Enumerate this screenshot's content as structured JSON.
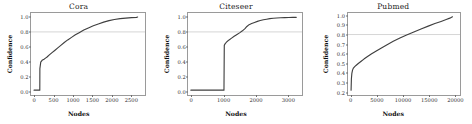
{
  "figure": {
    "background": "#ffffff",
    "line_color": "#3f3f3f",
    "hline_color": "#c9c9c9",
    "frame_color": "#9a9a9a",
    "n_panels": 3
  },
  "chart_data": [
    {
      "type": "line",
      "title": "Cora",
      "xlabel": "Nodes",
      "ylabel": "Confidence",
      "xlim": [
        -80,
        2850
      ],
      "ylim": [
        -0.04,
        1.06
      ],
      "xticks": [
        0,
        500,
        1000,
        1500,
        2000,
        2500
      ],
      "xticklabels": [
        "0",
        "500",
        "1000",
        "1500",
        "2000",
        "2500"
      ],
      "yticks": [
        0.0,
        0.2,
        0.4,
        0.6,
        0.8,
        1.0
      ],
      "yticklabels": [
        "0.0",
        "0.2",
        "0.4",
        "0.6",
        "0.8",
        "1.0"
      ],
      "grid": false,
      "legend": null,
      "annotations": [
        {
          "type": "hline",
          "y": 0.8,
          "color": "#c9c9c9",
          "style": "solid"
        }
      ],
      "series": [
        {
          "name": "confidence",
          "color": "#3f3f3f",
          "x": [
            0,
            40,
            90,
            140,
            150,
            152,
            175,
            210,
            260,
            300,
            340,
            400,
            470,
            540,
            620,
            700,
            790,
            880,
            980,
            1080,
            1180,
            1300,
            1420,
            1550,
            1680,
            1820,
            1960,
            2100,
            2250,
            2400,
            2550,
            2680,
            2708
          ],
          "y": [
            0.0,
            0.0,
            0.0,
            0.0,
            0.0,
            0.295,
            0.385,
            0.41,
            0.425,
            0.44,
            0.455,
            0.485,
            0.515,
            0.545,
            0.58,
            0.615,
            0.655,
            0.69,
            0.725,
            0.76,
            0.79,
            0.825,
            0.855,
            0.885,
            0.91,
            0.935,
            0.955,
            0.97,
            0.982,
            0.99,
            0.996,
            1.0,
            1.005
          ]
        }
      ]
    },
    {
      "type": "line",
      "title": "Citeseer",
      "xlabel": "Nodes",
      "ylabel": "Confidence",
      "xlim": [
        -90,
        3430
      ],
      "ylim": [
        -0.04,
        1.06
      ],
      "xticks": [
        0,
        1000,
        2000,
        3000
      ],
      "xticklabels": [
        "0",
        "1000",
        "2000",
        "3000"
      ],
      "yticks": [
        0.0,
        0.2,
        0.4,
        0.6,
        0.8,
        1.0
      ],
      "yticklabels": [
        "0.0",
        "0.2",
        "0.4",
        "0.6",
        "0.8",
        "1.0"
      ],
      "grid": false,
      "legend": null,
      "annotations": [
        {
          "type": "hline",
          "y": 0.8,
          "color": "#c9c9c9",
          "style": "solid"
        }
      ],
      "series": [
        {
          "name": "confidence",
          "color": "#3f3f3f",
          "x": [
            0,
            200,
            400,
            600,
            800,
            950,
            1040,
            1050,
            1080,
            1130,
            1200,
            1280,
            1360,
            1450,
            1540,
            1620,
            1700,
            1760,
            1830,
            1910,
            2000,
            2090,
            2180,
            2280,
            2380,
            2480,
            2590,
            2700,
            2820,
            2950,
            3080,
            3200,
            3312
          ],
          "y": [
            0.0,
            0.0,
            0.0,
            0.0,
            0.0,
            0.0,
            0.0,
            0.615,
            0.64,
            0.665,
            0.69,
            0.715,
            0.74,
            0.765,
            0.79,
            0.815,
            0.845,
            0.875,
            0.9,
            0.915,
            0.93,
            0.945,
            0.957,
            0.967,
            0.975,
            0.982,
            0.987,
            0.991,
            0.994,
            0.997,
            0.999,
            1.0,
            1.0
          ]
        }
      ]
    },
    {
      "type": "line",
      "title": "Pubmed",
      "xlabel": "Nodes",
      "ylabel": "Confidence",
      "xlim": [
        -600,
        20800
      ],
      "ylim": [
        0.175,
        1.03
      ],
      "xticks": [
        0,
        5000,
        10000,
        15000,
        20000
      ],
      "xticklabels": [
        "0",
        "5000",
        "10000",
        "15000",
        "20000"
      ],
      "yticks": [
        0.2,
        0.3,
        0.4,
        0.5,
        0.6,
        0.7,
        0.8,
        0.9,
        1.0
      ],
      "yticklabels": [
        "0.2",
        "0.3",
        "0.4",
        "0.5",
        "0.6",
        "0.7",
        "0.8",
        "0.9",
        "1.0"
      ],
      "grid": false,
      "legend": null,
      "annotations": [
        {
          "type": "hline",
          "y": 0.8,
          "color": "#c9c9c9",
          "style": "solid"
        }
      ],
      "series": [
        {
          "name": "confidence",
          "color": "#3f3f3f",
          "x": [
            0,
            60,
            150,
            280,
            450,
            700,
            1000,
            1400,
            1900,
            2500,
            3200,
            4000,
            4900,
            5900,
            7000,
            8200,
            9500,
            10800,
            12200,
            13600,
            15000,
            16300,
            17500,
            18500,
            19200,
            19717
          ],
          "y": [
            0.205,
            0.325,
            0.385,
            0.42,
            0.442,
            0.458,
            0.472,
            0.49,
            0.512,
            0.538,
            0.565,
            0.595,
            0.625,
            0.657,
            0.692,
            0.727,
            0.762,
            0.795,
            0.828,
            0.86,
            0.89,
            0.917,
            0.94,
            0.96,
            0.975,
            0.99
          ]
        }
      ]
    }
  ]
}
